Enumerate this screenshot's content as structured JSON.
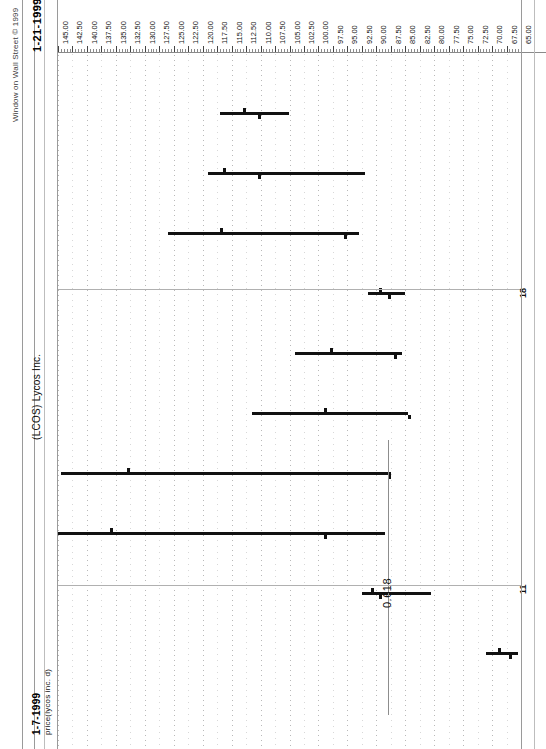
{
  "window": {
    "copyright": "Window on Wall Street © 1999",
    "date_right": "1-21-1999",
    "date_left": "1-7-1999",
    "series_title": "(LCOS)  Lycos Inc.",
    "series_subtitle": "price(lycos inc. d)",
    "fib_label": "0.618",
    "date_tick_upper": "18",
    "date_tick_lower": "11"
  },
  "chart_data": {
    "type": "bar",
    "chart_subtype": "ohlc-bar",
    "title": "(LCOS)  Lycos Inc.",
    "subtitle": "price(lycos inc. d)",
    "source": "Window on Wall Street © 1999",
    "orientation": "rotated-90-ccw",
    "xlabel": "Date",
    "ylabel": "Price",
    "date_range": [
      "1-7-1999",
      "1-21-1999"
    ],
    "grid": true,
    "legend": false,
    "ylim": [
      65.0,
      145.0
    ],
    "ytick_step": 2.5,
    "yticks": [
      "145.00",
      "142.50",
      "140.00",
      "137.50",
      "135.00",
      "132.50",
      "130.00",
      "127.50",
      "125.00",
      "122.50",
      "120.00",
      "117.50",
      "115.00",
      "112.50",
      "110.00",
      "107.50",
      "105.00",
      "102.50",
      "100.00",
      "97.50",
      "95.00",
      "92.50",
      "90.00",
      "87.50",
      "85.00",
      "82.50",
      "80.00",
      "77.50",
      "75.00",
      "72.50",
      "70.00",
      "67.50",
      "65.00"
    ],
    "xticks": [
      "11",
      "18"
    ],
    "annotations": [
      {
        "label": "0.618",
        "type": "fibonacci-retracement",
        "value": 88.0
      }
    ],
    "categories": [
      "1-7-1999",
      "1-8-1999",
      "1-11-1999",
      "1-12-1999",
      "1-13-1999",
      "1-14-1999",
      "1-15-1999",
      "1-19-1999",
      "1-20-1999",
      "1-21-1999"
    ],
    "series": [
      {
        "name": "high",
        "values": [
          67.5,
          85.5,
          99.5,
          113.0,
          117.5,
          128.5,
          144.5,
          126.0,
          119.0,
          117.0
        ]
      },
      {
        "name": "low",
        "values": [
          65.5,
          74.0,
          79.0,
          88.0,
          82.0,
          73.0,
          67.0,
          93.0,
          92.0,
          105.0
        ]
      },
      {
        "name": "open",
        "values": [
          67.5,
          81.5,
          95.5,
          102.5,
          113.0,
          123.5,
          138.0,
          117.0,
          116.5,
          113.0
        ]
      },
      {
        "name": "close",
        "values": [
          66.5,
          80.0,
          80.5,
          95.5,
          89.0,
          78.5,
          88.0,
          95.5,
          110.5,
          110.5
        ]
      }
    ],
    "bars": [
      {
        "date": "1-21-1999",
        "high": 117.0,
        "low": 105.0,
        "open": 113.0,
        "close": 110.5
      },
      {
        "date": "1-20-1999",
        "high": 119.0,
        "low": 92.0,
        "open": 116.5,
        "close": 110.5
      },
      {
        "date": "1-19-1999",
        "high": 126.0,
        "low": 93.0,
        "open": 117.0,
        "close": 95.5
      },
      {
        "date": "1-15-1999",
        "high": 91.5,
        "low": 85.0,
        "open": 89.5,
        "close": 88.0
      },
      {
        "date": "1-14-1999",
        "high": 104.0,
        "low": 85.5,
        "open": 98.0,
        "close": 87.0
      },
      {
        "date": "1-13-1999",
        "high": 111.5,
        "low": 84.5,
        "open": 99.0,
        "close": 84.5
      },
      {
        "date": "1-12-1999",
        "high": 144.5,
        "low": 87.5,
        "open": 133.0,
        "close": 88.0
      },
      {
        "date": "1-11-1999",
        "high": 145.0,
        "low": 88.5,
        "open": 136.0,
        "close": 99.0
      },
      {
        "date": "1-8-1999",
        "high": 92.5,
        "low": 80.5,
        "open": 91.0,
        "close": 89.5
      },
      {
        "date": "1-7-1999",
        "high": 71.0,
        "low": 65.5,
        "open": 69.0,
        "close": 67.0
      }
    ]
  }
}
